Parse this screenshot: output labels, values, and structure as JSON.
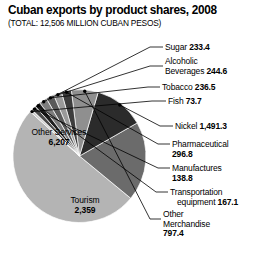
{
  "header": {
    "title": "Cuban exports by product shares, 2008",
    "subtitle": "(TOTAL: 12,506 MILLION CUBAN PESOS)"
  },
  "labels": {
    "sugar_name": "Sugar",
    "sugar_value": "233.4",
    "alcoholic_name": "Alcoholic",
    "alcoholic_name2": "Beverages",
    "alcoholic_value": "244.6",
    "tobacco_name": "Tobacco",
    "tobacco_value": "236.5",
    "fish_name": "Fish",
    "fish_value": "73.7",
    "nickel_name": "Nickel",
    "nickel_value": "1,491.3",
    "pharma_name": "Pharmaceutical",
    "pharma_value": "296.8",
    "manufactures_name": "Manufactures",
    "manufactures_value": "138.8",
    "transport_name": "Transportation",
    "transport_name2": "equipment",
    "transport_value": "167.1",
    "othermerch_name": "Other",
    "othermerch_name2": "Merchandise",
    "othermerch_value": "797.4",
    "otherservices_name": "Other Services",
    "otherservices_value": "6,207",
    "tourism_name": "Tourism",
    "tourism_value": "2,359"
  },
  "chart_data": {
    "type": "pie",
    "title": "Cuban exports by product shares, 2008",
    "subtitle": "(TOTAL: 12,506 MILLION CUBAN PESOS)",
    "total": 12506,
    "units": "million Cuban pesos",
    "grid": false,
    "legend": "none",
    "label_style": "in-slice and leader-line callouts",
    "categories": [
      "Other Services",
      "Tourism",
      "Nickel",
      "Other Merchandise",
      "Pharmaceutical",
      "Alcoholic Beverages",
      "Tobacco",
      "Sugar",
      "Transportation equipment",
      "Manufactures",
      "Fish"
    ],
    "values": [
      6207,
      2359,
      1491.3,
      797.4,
      296.8,
      244.6,
      236.5,
      233.4,
      167.1,
      138.8,
      73.7
    ],
    "slice_colors": [
      "#b4b4b4",
      "#6b6b6b",
      "#2b2b2b",
      "#8f8f8f",
      "#3d3d3d",
      "#9a9a9a",
      "#5a5a5a",
      "#7d7d7d",
      "#1f1f1f",
      "#4a4a4a",
      "#cfcfcf"
    ]
  }
}
